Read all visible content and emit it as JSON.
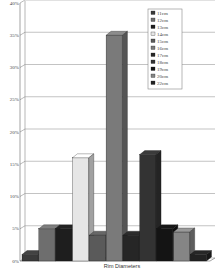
{
  "chart_data": {
    "type": "bar",
    "style": "3d-clustered",
    "title": "",
    "xlabel": "Rim Diameters",
    "ylabel": "",
    "ylim": [
      0,
      40
    ],
    "yticks": [
      "0%",
      "5%",
      "10%",
      "15%",
      "20%",
      "25%",
      "30%",
      "35%",
      "40%"
    ],
    "grid": true,
    "legend_position": "top-right-inside",
    "categories": [
      "Rim Diameters"
    ],
    "series": [
      {
        "name": "11cm",
        "values": [
          1
        ],
        "color": "#3a3a3a"
      },
      {
        "name": "12cm",
        "values": [
          5
        ],
        "color": "#6e6e6e"
      },
      {
        "name": "13cm",
        "values": [
          5
        ],
        "color": "#1e1e1e"
      },
      {
        "name": "14cm",
        "values": [
          16
        ],
        "color": "#e6e6e6"
      },
      {
        "name": "15cm",
        "values": [
          4
        ],
        "color": "#5a5a5a"
      },
      {
        "name": "16cm",
        "values": [
          35
        ],
        "color": "#7a7a7a"
      },
      {
        "name": "17cm",
        "values": [
          4
        ],
        "color": "#262626"
      },
      {
        "name": "18cm",
        "values": [
          16.5
        ],
        "color": "#333333"
      },
      {
        "name": "19cm",
        "values": [
          5
        ],
        "color": "#141414"
      },
      {
        "name": "20cm",
        "values": [
          4.5
        ],
        "color": "#858585"
      },
      {
        "name": "22cm",
        "values": [
          1
        ],
        "color": "#222222"
      }
    ]
  }
}
